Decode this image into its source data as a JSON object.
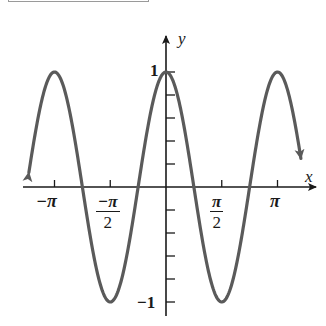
{
  "chart_data": {
    "type": "line",
    "title": "",
    "function": "y = cos(2x)",
    "xlabel": "x",
    "ylabel": "y",
    "xlim": [
      -1.23,
      1.21
    ],
    "xlim_units": "pi",
    "ylim": [
      -1.1,
      1.1
    ],
    "grid": false,
    "legend": null,
    "x_ticks": [
      {
        "value": -3.14159,
        "label": "−π"
      },
      {
        "value": -1.5708,
        "label_num": "−π",
        "label_den": "2"
      },
      {
        "value": 1.5708,
        "label_num": "π",
        "label_den": "2"
      },
      {
        "value": 3.14159,
        "label": "π"
      }
    ],
    "y_ticks": [
      -1,
      -0.8,
      -0.6,
      -0.4,
      -0.2,
      0.2,
      0.4,
      0.6,
      0.8,
      1
    ],
    "y_tick_labels": [
      {
        "value": 1,
        "label": "1"
      },
      {
        "value": -1,
        "label": "−1"
      }
    ],
    "key_points": [
      {
        "x": "-π",
        "y": 1
      },
      {
        "x": "-3π/4",
        "y": 0
      },
      {
        "x": "-π/2",
        "y": -1
      },
      {
        "x": "-π/4",
        "y": 0
      },
      {
        "x": "0",
        "y": 1
      },
      {
        "x": "π/4",
        "y": 0
      },
      {
        "x": "π/2",
        "y": -1
      },
      {
        "x": "3π/4",
        "y": 0
      },
      {
        "x": "π",
        "y": 1
      }
    ],
    "curve_color": "#5a5a5a",
    "axis_color": "#1a1a1a",
    "end_arrows": true
  },
  "labels": {
    "x_axis": "x",
    "y_axis": "y",
    "y_one": "1",
    "y_neg_one": "−1",
    "x_neg_pi": "−π",
    "x_neg_half_pi_num": "−π",
    "x_neg_half_pi_den": "2",
    "x_half_pi_num": "π",
    "x_half_pi_den": "2",
    "x_pi": "π"
  }
}
